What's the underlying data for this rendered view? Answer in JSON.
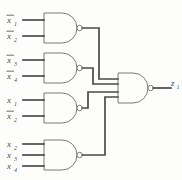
{
  "figure": {
    "background_color": "#fdfdfc",
    "wire_color": "#4a4a4a",
    "gate_color": "#6b6b6b"
  },
  "gates": [
    {
      "id": "gate-1",
      "type": "NAND",
      "inputs": 2,
      "input_labels": [
        {
          "base": "x",
          "subscript": "1",
          "negated": true,
          "text": "x̉1"
        },
        {
          "base": "x",
          "subscript": "2",
          "negated": true,
          "text": "x̉2"
        }
      ]
    },
    {
      "id": "gate-2",
      "type": "NAND",
      "inputs": 2,
      "input_labels": [
        {
          "base": "x",
          "subscript": "3",
          "negated": true,
          "text": "x̉3"
        },
        {
          "base": "x",
          "subscript": "4",
          "negated": true,
          "text": "x̉4"
        }
      ]
    },
    {
      "id": "gate-3",
      "type": "NAND",
      "inputs": 2,
      "input_labels": [
        {
          "base": "x",
          "subscript": "1",
          "negated": false,
          "text": "x1"
        },
        {
          "base": "x",
          "subscript": "2",
          "negated": true,
          "text": "x̉2"
        }
      ]
    },
    {
      "id": "gate-4",
      "type": "NAND",
      "inputs": 3,
      "input_labels": [
        {
          "base": "x",
          "subscript": "2",
          "negated": false,
          "text": "x2"
        },
        {
          "base": "x",
          "subscript": "3",
          "negated": false,
          "text": "x3"
        },
        {
          "base": "x",
          "subscript": "4",
          "negated": false,
          "text": "x4"
        }
      ]
    },
    {
      "id": "gate-output",
      "type": "NAND",
      "inputs": 4,
      "input_labels": [],
      "output_label": {
        "base": "z",
        "subscript": "1",
        "negated": false,
        "text": "z1"
      }
    }
  ]
}
